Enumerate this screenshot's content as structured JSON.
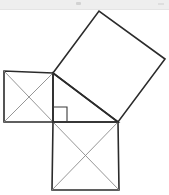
{
  "canvas": {
    "width": 169,
    "height": 195,
    "background_color": "#ffffff"
  },
  "chrome": {
    "present": true,
    "height": 10,
    "background_color": "#eeeeee",
    "border_color": "#e4e4e4"
  },
  "figure": {
    "stroke_color": "#2b2b2b",
    "diagonal_color": "#8a8a8a",
    "fill_color": "none",
    "stroke_width": 1.6,
    "diagonal_width": 0.9
  },
  "geometry": {
    "triangle": {
      "name": "right-triangle",
      "vertices": [
        {
          "label": "A",
          "x": 53,
          "y": 73
        },
        {
          "label": "B",
          "x": 53,
          "y": 122
        },
        {
          "label": "C",
          "x": 118,
          "y": 122
        }
      ],
      "right_angle_at": "B"
    },
    "right_angle_marker": {
      "name": "right-angle-marker",
      "x": 53,
      "y": 107,
      "size": 14,
      "stroke_color": "#3a3a3a"
    },
    "squares": [
      {
        "name": "leg-square-left",
        "side_label": "a",
        "has_diagonals": true,
        "points": "53,73 4,71 4,122 53,122"
      },
      {
        "name": "leg-square-bottom",
        "side_label": "b",
        "has_diagonals": true,
        "points": "53,122 118,122 119,190 52,190"
      },
      {
        "name": "hypotenuse-square",
        "side_label": "c",
        "has_diagonals": false,
        "points": "53,73 99,11 165,59 118,122"
      }
    ]
  }
}
